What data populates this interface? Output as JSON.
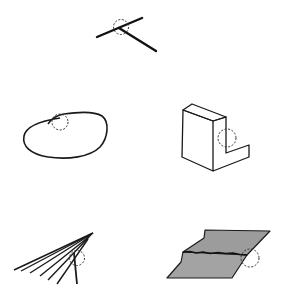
{
  "figure": {
    "colors": {
      "ink": "#111111",
      "sheet_fill": "#9c9c9c",
      "background": "#ffffff"
    },
    "panels": [
      {
        "id": "t-junction",
        "label": "crossing lines (T-junction)",
        "position": "top-center"
      },
      {
        "id": "closed-curve",
        "label": "closed curve with self-overlap",
        "position": "middle-left"
      },
      {
        "id": "l-block",
        "label": "L-shaped block",
        "position": "middle-right"
      },
      {
        "id": "fan-lines",
        "label": "fan of converging lines",
        "position": "bottom-left"
      },
      {
        "id": "folded-sheet",
        "label": "folded/torn gray sheet",
        "position": "bottom-right"
      }
    ]
  }
}
